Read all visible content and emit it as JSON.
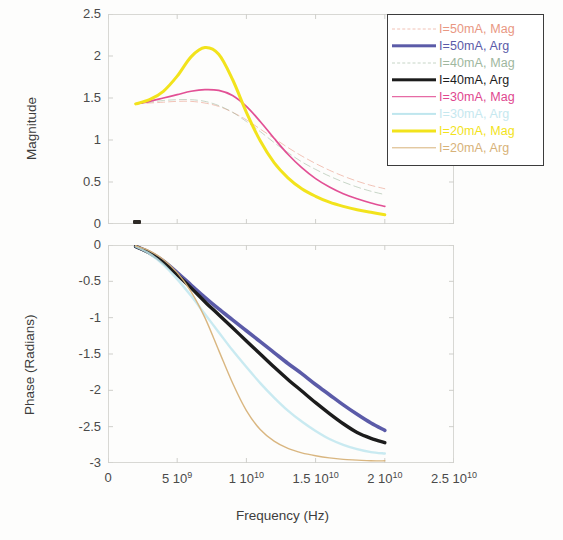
{
  "figure": {
    "xlabel": "Frequency (Hz)",
    "ylabel_top": "Magnitude",
    "ylabel_bottom": "Phase (Radians)"
  },
  "axes": {
    "x_ticks": [
      {
        "mantissa": "0",
        "exp": ""
      },
      {
        "mantissa": "5 10",
        "exp": "9"
      },
      {
        "mantissa": "1 10",
        "exp": "10"
      },
      {
        "mantissa": "1.5 10",
        "exp": "10"
      },
      {
        "mantissa": "2 10",
        "exp": "10"
      },
      {
        "mantissa": "2.5 10",
        "exp": "10"
      }
    ],
    "y_ticks_top": [
      "2.5",
      "2",
      "1.5",
      "1",
      "0.5",
      "0"
    ],
    "y_ticks_bottom": [
      "0",
      "-0.5",
      "-1",
      "-1.5",
      "-2",
      "-2.5",
      "-3"
    ]
  },
  "legend": {
    "items": [
      {
        "label": "I=50mA, Mag",
        "color": "#e8927c",
        "style": "faint-dash",
        "width": 1.0
      },
      {
        "label": "I=50mA, Arg",
        "color": "#5b5ba8",
        "style": "solid",
        "width": 3.4
      },
      {
        "label": "I=40mA, Mag",
        "color": "#9ab49a",
        "style": "faint-dash",
        "width": 1.0
      },
      {
        "label": "I=40mA, Arg",
        "color": "#1c1c1c",
        "style": "solid",
        "width": 3.4
      },
      {
        "label": "I=30mA, Mag",
        "color": "#e0478f",
        "style": "solid",
        "width": 1.6
      },
      {
        "label": "I=30mA, Arg",
        "color": "#bfe6ee",
        "style": "solid",
        "width": 2.2
      },
      {
        "label": "I=20mA, Mag",
        "color": "#f2e31c",
        "style": "solid",
        "width": 3.0
      },
      {
        "label": "I=20mA, Arg",
        "color": "#d7b279",
        "style": "solid",
        "width": 1.4
      }
    ]
  },
  "chart_data": {
    "type": "line",
    "title": "",
    "subtitle": "Modulation response magnitude and phase vs frequency for laser bias currents 20-50 mA",
    "xlabel": "Frequency (Hz)",
    "xlim": [
      0,
      25000000000
    ],
    "x_tick_values": [
      0,
      5000000000,
      10000000000,
      15000000000,
      20000000000,
      25000000000
    ],
    "grid": false,
    "legend_position": "top-right",
    "panels": [
      {
        "name": "magnitude",
        "ylabel": "Magnitude",
        "ylim": [
          0,
          2.5
        ],
        "y_tick_values": [
          0,
          0.5,
          1,
          1.5,
          2,
          2.5
        ],
        "series": [
          {
            "name": "I=50mA, Mag",
            "color": "#e8927c",
            "style": "faint-dash",
            "x": [
              2000000000.0,
              3000000000.0,
              4000000000.0,
              5000000000.0,
              6000000000.0,
              7000000000.0,
              8000000000.0,
              9000000000.0,
              10000000000.0,
              11000000000.0,
              12000000000.0,
              13000000000.0,
              14000000000.0,
              15000000000.0,
              16000000000.0,
              17000000000.0,
              18000000000.0,
              19000000000.0,
              20000000000.0
            ],
            "y": [
              1.43,
              1.44,
              1.45,
              1.46,
              1.46,
              1.44,
              1.4,
              1.33,
              1.24,
              1.13,
              1.02,
              0.91,
              0.81,
              0.72,
              0.64,
              0.57,
              0.51,
              0.46,
              0.42
            ]
          },
          {
            "name": "I=40mA, Mag",
            "color": "#9ab49a",
            "style": "faint-dash",
            "x": [
              2000000000.0,
              3000000000.0,
              4000000000.0,
              5000000000.0,
              6000000000.0,
              7000000000.0,
              8000000000.0,
              9000000000.0,
              10000000000.0,
              11000000000.0,
              12000000000.0,
              13000000000.0,
              14000000000.0,
              15000000000.0,
              16000000000.0,
              17000000000.0,
              18000000000.0,
              19000000000.0,
              20000000000.0
            ],
            "y": [
              1.43,
              1.45,
              1.47,
              1.48,
              1.48,
              1.46,
              1.41,
              1.33,
              1.22,
              1.1,
              0.97,
              0.85,
              0.74,
              0.65,
              0.57,
              0.5,
              0.44,
              0.39,
              0.35
            ]
          },
          {
            "name": "I=30mA, Mag",
            "color": "#e0478f",
            "style": "solid",
            "x": [
              2000000000.0,
              3000000000.0,
              4000000000.0,
              5000000000.0,
              6000000000.0,
              7000000000.0,
              8000000000.0,
              9000000000.0,
              10000000000.0,
              11000000000.0,
              12000000000.0,
              13000000000.0,
              14000000000.0,
              15000000000.0,
              16000000000.0,
              17000000000.0,
              18000000000.0,
              19000000000.0,
              20000000000.0
            ],
            "y": [
              1.43,
              1.46,
              1.5,
              1.54,
              1.58,
              1.6,
              1.59,
              1.53,
              1.4,
              1.22,
              1.02,
              0.83,
              0.67,
              0.54,
              0.44,
              0.36,
              0.3,
              0.25,
              0.21
            ]
          },
          {
            "name": "I=20mA, Mag",
            "color": "#f2e31c",
            "style": "solid",
            "x": [
              2000000000.0,
              3000000000.0,
              4000000000.0,
              5000000000.0,
              6000000000.0,
              7000000000.0,
              8000000000.0,
              9000000000.0,
              10000000000.0,
              11000000000.0,
              12000000000.0,
              13000000000.0,
              14000000000.0,
              15000000000.0,
              16000000000.0,
              17000000000.0,
              18000000000.0,
              19000000000.0,
              20000000000.0
            ],
            "y": [
              1.43,
              1.48,
              1.58,
              1.76,
              1.99,
              2.1,
              2.02,
              1.72,
              1.33,
              0.99,
              0.73,
              0.55,
              0.42,
              0.33,
              0.26,
              0.21,
              0.17,
              0.14,
              0.11
            ]
          }
        ]
      },
      {
        "name": "phase",
        "ylabel": "Phase (Radians)",
        "ylim": [
          -3,
          0
        ],
        "y_tick_values": [
          -3,
          -2.5,
          -2,
          -1.5,
          -1,
          -0.5,
          0
        ],
        "series": [
          {
            "name": "I=50mA, Arg",
            "color": "#5b5ba8",
            "style": "solid",
            "x": [
              2000000000.0,
              3000000000.0,
              4000000000.0,
              5000000000.0,
              6000000000.0,
              7000000000.0,
              8000000000.0,
              9000000000.0,
              10000000000.0,
              11000000000.0,
              12000000000.0,
              13000000000.0,
              14000000000.0,
              15000000000.0,
              16000000000.0,
              17000000000.0,
              18000000000.0,
              19000000000.0,
              20000000000.0
            ],
            "y": [
              -0.02,
              -0.1,
              -0.22,
              -0.38,
              -0.55,
              -0.72,
              -0.88,
              -1.03,
              -1.18,
              -1.33,
              -1.48,
              -1.63,
              -1.77,
              -1.92,
              -2.06,
              -2.2,
              -2.33,
              -2.45,
              -2.55
            ]
          },
          {
            "name": "I=40mA, Arg",
            "color": "#1c1c1c",
            "style": "solid",
            "x": [
              2000000000.0,
              3000000000.0,
              4000000000.0,
              5000000000.0,
              6000000000.0,
              7000000000.0,
              8000000000.0,
              9000000000.0,
              10000000000.0,
              11000000000.0,
              12000000000.0,
              13000000000.0,
              14000000000.0,
              15000000000.0,
              16000000000.0,
              17000000000.0,
              18000000000.0,
              19000000000.0,
              20000000000.0
            ],
            "y": [
              -0.02,
              -0.11,
              -0.24,
              -0.41,
              -0.59,
              -0.78,
              -0.96,
              -1.14,
              -1.32,
              -1.5,
              -1.68,
              -1.85,
              -2.01,
              -2.17,
              -2.32,
              -2.46,
              -2.58,
              -2.66,
              -2.72
            ]
          },
          {
            "name": "I=30mA, Arg",
            "color": "#bfe6ee",
            "style": "solid",
            "x": [
              2000000000.0,
              3000000000.0,
              4000000000.0,
              5000000000.0,
              6000000000.0,
              7000000000.0,
              8000000000.0,
              9000000000.0,
              10000000000.0,
              11000000000.0,
              12000000000.0,
              13000000000.0,
              14000000000.0,
              15000000000.0,
              16000000000.0,
              17000000000.0,
              18000000000.0,
              19000000000.0,
              20000000000.0
            ],
            "y": [
              -0.02,
              -0.12,
              -0.27,
              -0.47,
              -0.7,
              -0.95,
              -1.2,
              -1.45,
              -1.68,
              -1.9,
              -2.1,
              -2.28,
              -2.43,
              -2.56,
              -2.67,
              -2.75,
              -2.81,
              -2.85,
              -2.87
            ]
          },
          {
            "name": "I=20mA, Arg",
            "color": "#d7b279",
            "style": "solid",
            "x": [
              2000000000.0,
              3000000000.0,
              4000000000.0,
              5000000000.0,
              6000000000.0,
              7000000000.0,
              8000000000.0,
              9000000000.0,
              10000000000.0,
              11000000000.0,
              12000000000.0,
              13000000000.0,
              14000000000.0,
              15000000000.0,
              16000000000.0,
              17000000000.0,
              18000000000.0,
              19000000000.0,
              20000000000.0
            ],
            "y": [
              -0.01,
              -0.08,
              -0.2,
              -0.38,
              -0.64,
              -1.0,
              -1.45,
              -1.9,
              -2.28,
              -2.54,
              -2.7,
              -2.8,
              -2.86,
              -2.9,
              -2.93,
              -2.95,
              -2.96,
              -2.97,
              -2.97
            ]
          }
        ]
      }
    ]
  }
}
